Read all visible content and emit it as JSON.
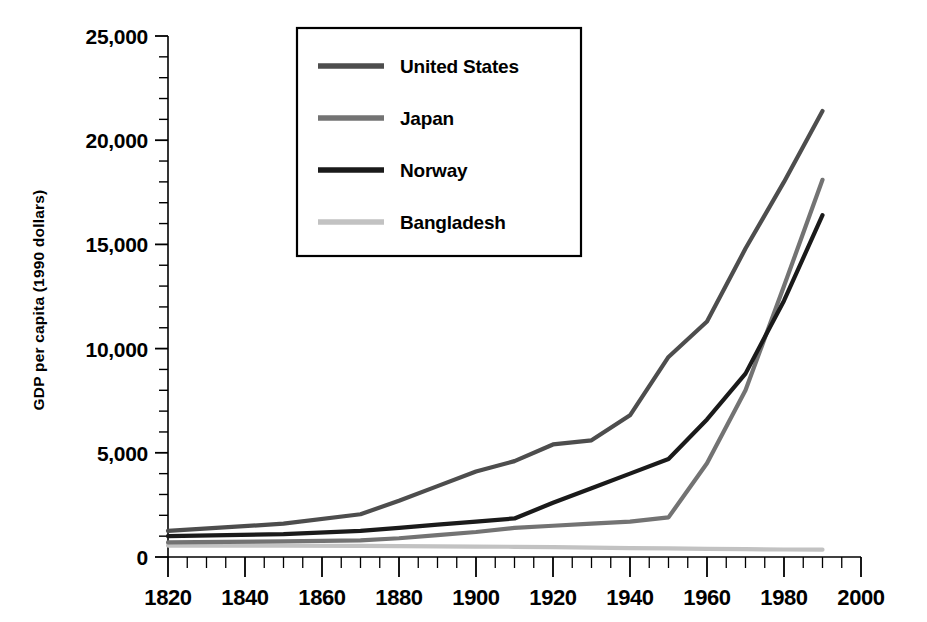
{
  "chart_data": {
    "type": "line",
    "title": "",
    "subtitle": "",
    "xlabel": "",
    "ylabel": "GDP per capita (1990 dollars)",
    "xlim": [
      1820,
      2000
    ],
    "ylim": [
      0,
      25000
    ],
    "grid": false,
    "legend_position": "top-center-inside",
    "x_major_ticks": [
      1820,
      1840,
      1860,
      1880,
      1900,
      1920,
      1940,
      1960,
      1980,
      2000
    ],
    "x_tick_labels": [
      "1820",
      "1840",
      "1860",
      "1880",
      "1900",
      "1920",
      "1940",
      "1960",
      "1980",
      "2000"
    ],
    "x_minor_tick_step": 5,
    "y_major_ticks": [
      0,
      5000,
      10000,
      15000,
      20000,
      25000
    ],
    "y_tick_labels": [
      "0",
      "5,000",
      "10,000",
      "15,000",
      "20,000",
      "25,000"
    ],
    "y_minor_tick_step": 1000,
    "series": [
      {
        "name": "United States",
        "color": "#4d4d4d",
        "x": [
          1820,
          1850,
          1870,
          1880,
          1890,
          1900,
          1910,
          1920,
          1930,
          1940,
          1950,
          1960,
          1970,
          1980,
          1990
        ],
        "values": [
          1250,
          1600,
          2050,
          2700,
          3400,
          4100,
          4600,
          5400,
          5600,
          6800,
          9600,
          11300,
          14800,
          18000,
          21400
        ]
      },
      {
        "name": "Japan",
        "color": "#737373",
        "x": [
          1820,
          1850,
          1870,
          1880,
          1890,
          1900,
          1910,
          1920,
          1930,
          1940,
          1950,
          1960,
          1970,
          1980,
          1990
        ],
        "values": [
          700,
          750,
          800,
          900,
          1050,
          1200,
          1400,
          1500,
          1600,
          1700,
          1900,
          4500,
          8000,
          13000,
          18100
        ]
      },
      {
        "name": "Norway",
        "color": "#1a1a1a",
        "x": [
          1820,
          1850,
          1870,
          1880,
          1890,
          1900,
          1910,
          1920,
          1930,
          1940,
          1950,
          1960,
          1970,
          1980,
          1990
        ],
        "values": [
          1000,
          1100,
          1250,
          1400,
          1550,
          1700,
          1850,
          2600,
          3300,
          4000,
          4700,
          6600,
          8800,
          12300,
          16400
        ]
      },
      {
        "name": "Bangladesh",
        "color": "#c2c2c2",
        "x": [
          1820,
          1850,
          1870,
          1880,
          1890,
          1900,
          1910,
          1920,
          1930,
          1940,
          1950,
          1960,
          1970,
          1980,
          1990
        ],
        "values": [
          550,
          540,
          530,
          520,
          510,
          500,
          490,
          470,
          450,
          430,
          410,
          390,
          375,
          360,
          350
        ]
      }
    ]
  },
  "legend": {
    "items": [
      {
        "label": "United States"
      },
      {
        "label": "Japan"
      },
      {
        "label": "Norway"
      },
      {
        "label": "Bangladesh"
      }
    ]
  },
  "axes": {
    "ylabel": "GDP per capita (1990 dollars)"
  }
}
